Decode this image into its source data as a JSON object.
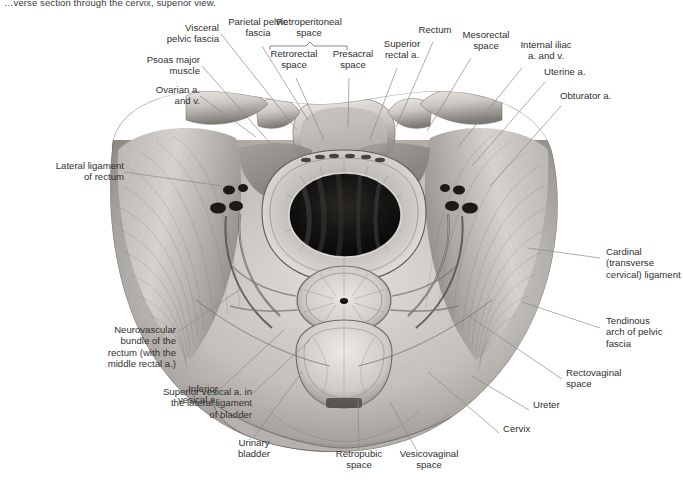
{
  "figure": {
    "caption": "…verse section through the cervix, superior view.",
    "view": "superior view",
    "style": "grayscale anatomical illustration",
    "colors": {
      "background": "#ffffff",
      "label_text": "#303030",
      "leader_line": "#8a8a8a",
      "bracket_line": "#6f6f6f",
      "tissue_light": "#d9d6d2",
      "tissue_mid": "#a5a19c",
      "tissue_dark": "#5e5b57",
      "lumen_dark": "#141414"
    }
  },
  "bracket": {
    "label": "Retroperitoneal\nspace",
    "children": [
      "Retrorectal\nspace",
      "Presacral\nspace"
    ]
  },
  "labels": [
    {
      "id": "visceral-pelvic-fascia",
      "text": "Visceral\npelvic fascia",
      "align": "right",
      "x": 133,
      "y": 27,
      "w": 84,
      "lx": 219,
      "ly": 34,
      "tx": 295,
      "ty": 128
    },
    {
      "id": "parietal-pelvic-fascia",
      "text": "Parietal pelvic\nfascia",
      "align": "center",
      "x": 213,
      "y": 19,
      "w": 90,
      "lx": 262,
      "ly": 45,
      "tx": 307,
      "ty": 119
    },
    {
      "id": "retroperitoneal-space",
      "text": "Retroperitoneal\nspace",
      "align": "center",
      "x": 264,
      "y": 19,
      "w": 92,
      "lx": 0,
      "ly": 0,
      "tx": 0,
      "ty": 0
    },
    {
      "id": "retrorectal-space",
      "text": "Retrorectal\nspace",
      "align": "center",
      "x": 263,
      "y": 51,
      "w": 66,
      "lx": 296,
      "ly": 76,
      "tx": 323,
      "ty": 137
    },
    {
      "id": "presacral-space",
      "text": "Presacral\nspace",
      "align": "center",
      "x": 325,
      "y": 51,
      "w": 62,
      "lx": 349,
      "ly": 76,
      "tx": 347,
      "ty": 124
    },
    {
      "id": "superior-rectal-a",
      "text": "Superior\nrectal a.",
      "align": "center",
      "x": 374,
      "y": 41,
      "w": 62,
      "lx": 396,
      "ly": 66,
      "tx": 369,
      "ty": 137
    },
    {
      "id": "rectum",
      "text": "Rectum",
      "align": "center",
      "x": 413,
      "y": 26,
      "w": 48,
      "lx": 432,
      "ly": 40,
      "tx": 394,
      "ty": 125
    },
    {
      "id": "mesorectal-space",
      "text": "Mesorectal\nspace",
      "align": "center",
      "x": 454,
      "y": 31,
      "w": 68,
      "lx": 470,
      "ly": 56,
      "tx": 425,
      "ty": 129
    },
    {
      "id": "internal-iliac-a-and-v",
      "text": "Internal iliac\na. and v.",
      "align": "center",
      "x": 510,
      "y": 41,
      "w": 76,
      "lx": 521,
      "ly": 66,
      "tx": 456,
      "ty": 145
    },
    {
      "id": "uterine-a",
      "text": "Uterine a.",
      "align": "left",
      "x": 546,
      "y": 68,
      "w": 66,
      "lx": 545,
      "ly": 80,
      "tx": 471,
      "ty": 163
    },
    {
      "id": "obturator-a",
      "text": "Obturator a.",
      "align": "left",
      "x": 562,
      "y": 92,
      "w": 76,
      "lx": 561,
      "ly": 104,
      "tx": 489,
      "ty": 182
    },
    {
      "id": "psoas-major-muscle",
      "text": "Psoas major\nmuscle",
      "align": "right",
      "x": 114,
      "y": 57,
      "w": 84,
      "lx": 200,
      "ly": 64,
      "tx": 268,
      "ty": 142
    },
    {
      "id": "ovarian-a-and-v",
      "text": "Ovarian a.\nand v.",
      "align": "right",
      "x": 110,
      "y": 87,
      "w": 88,
      "lx": 200,
      "ly": 94,
      "tx": 253,
      "ty": 135
    },
    {
      "id": "lateral-ligament-of-rectum",
      "text": "Lateral ligament\nof rectum",
      "align": "right",
      "x": 16,
      "y": 163,
      "w": 104,
      "lx": 124,
      "ly": 170,
      "tx": 219,
      "ty": 184
    },
    {
      "id": "cardinal-ligament",
      "text": "Cardinal\n(transverse\ncervical) ligament",
      "align": "left",
      "x": 605,
      "y": 249,
      "w": 74,
      "lx": 600,
      "ly": 257,
      "tx": 530,
      "ty": 245
    },
    {
      "id": "tendinous-arch-of-pelvic-fascia",
      "text": "Tendinous\narch of pelvic\nfascia",
      "align": "left",
      "x": 605,
      "y": 318,
      "w": 74,
      "lx": 600,
      "ly": 326,
      "tx": 523,
      "ty": 300
    },
    {
      "id": "rectovaginal-space",
      "text": "Rectovaginal\nspace",
      "align": "left",
      "x": 567,
      "y": 370,
      "w": 80,
      "lx": 562,
      "ly": 378,
      "tx": 468,
      "ty": 313
    },
    {
      "id": "ureter",
      "text": "Ureter",
      "align": "left",
      "x": 534,
      "y": 402,
      "w": 46,
      "lx": 530,
      "ly": 409,
      "tx": 474,
      "ty": 374
    },
    {
      "id": "cervix",
      "text": "Cervix",
      "align": "left",
      "x": 504,
      "y": 426,
      "w": 46,
      "lx": 500,
      "ly": 432,
      "tx": 430,
      "ty": 371
    },
    {
      "id": "vesicovaginal-space",
      "text": "Vesicovaginal\nspace",
      "align": "center",
      "x": 388,
      "y": 451,
      "w": 84,
      "lx": 414,
      "ly": 450,
      "tx": 388,
      "ty": 401
    },
    {
      "id": "retropubic-space",
      "text": "Retropubic\nspace",
      "align": "center",
      "x": 323,
      "y": 451,
      "w": 72,
      "lx": 359,
      "ly": 450,
      "tx": 358,
      "ty": 399
    },
    {
      "id": "urinary-bladder",
      "text": "Urinary\nbladder",
      "align": "center",
      "x": 226,
      "y": 440,
      "w": 56,
      "lx": 254,
      "ly": 439,
      "tx": 300,
      "ty": 372
    },
    {
      "id": "superior-vesical-a",
      "text": "Superior vesical a. in\nthe lateral ligament\nof bladder",
      "align": "right",
      "x": 118,
      "y": 389,
      "w": 132,
      "lx": 252,
      "ly": 396,
      "tx": 307,
      "ty": 340
    },
    {
      "id": "inferior-vesical-a",
      "text": "Inferior\nvesical a.",
      "align": "right",
      "x": 128,
      "y": 385,
      "w": 0,
      "lx": 0,
      "ly": 0,
      "tx": 0,
      "ty": 0
    },
    {
      "id": "neurovascular-bundle",
      "text": "Neurovascular\nbundle of the\nrectum (with the\nmiddle rectal a.)",
      "align": "right",
      "x": 62,
      "y": 327,
      "w": 112,
      "lx": 178,
      "ly": 334,
      "tx": 240,
      "ty": 286
    }
  ],
  "labels_extra": [
    {
      "id": "inferior-vesical-a-text",
      "text": "Inferior\nvesical a.",
      "align": "right",
      "x": 130,
      "y": 386,
      "w": 86,
      "lx": 218,
      "ly": 393,
      "tx": 280,
      "ty": 330
    }
  ]
}
